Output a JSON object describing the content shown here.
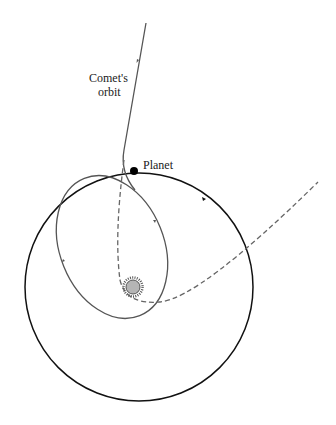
{
  "diagram": {
    "type": "orbital-diagram",
    "labels": {
      "comet_orbit_line1": "Comet's",
      "comet_orbit_line2": "orbit",
      "planet": "Planet"
    },
    "elements": {
      "planet_orbit": {
        "shape": "circle",
        "style": "solid",
        "color": "#111111"
      },
      "comet_captured_orbit": {
        "shape": "ellipse",
        "style": "solid",
        "color": "#555555"
      },
      "comet_incoming_path": {
        "shape": "line",
        "style": "solid",
        "color": "#555555"
      },
      "comet_alternate_path": {
        "shape": "curve",
        "style": "dashed",
        "color": "#666666"
      },
      "sun": {
        "shape": "star-disc",
        "fill": "#b0b0b0",
        "stroke": "#555555"
      },
      "planet": {
        "shape": "dot",
        "fill": "#000000"
      }
    }
  }
}
